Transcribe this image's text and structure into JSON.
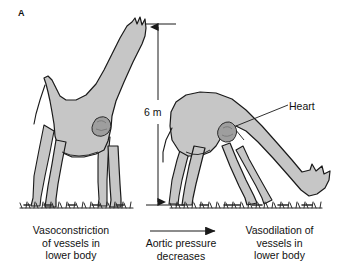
{
  "figure": {
    "panel_label": "A",
    "background_color": "#ffffff"
  },
  "measurement": {
    "height_label": "6 m"
  },
  "annotations": {
    "heart_label": "Heart"
  },
  "captions": {
    "left": "Vasoconstriction\nof vessels in\nlower body",
    "left_lines": [
      "Vasoconstriction",
      "of vessels in",
      "lower body"
    ],
    "middle": "Aortic pressure\ndecreases",
    "middle_lines": [
      "Aortic pressure",
      "decreases"
    ],
    "right": "Vasodilation of\nvessels in\nlower body",
    "right_lines": [
      "Vasodilation of",
      "vessels in",
      "lower body"
    ]
  },
  "illustration": {
    "subjects": [
      {
        "name": "giraffe-standing",
        "posture": "head-raised",
        "description": "Giraffe standing upright with neck extended vertically"
      },
      {
        "name": "giraffe-drinking",
        "posture": "head-lowered",
        "description": "Giraffe bent over with head lowered to ground level"
      }
    ],
    "ground": "grass-tufts"
  },
  "colors": {
    "body_fill": "#c6c6c6",
    "body_stroke": "#1a1a1a",
    "heart_fill": "#9e9e9e",
    "heart_stroke": "#2a2a2a",
    "text": "#111111",
    "grass": "#2b2b2b"
  }
}
